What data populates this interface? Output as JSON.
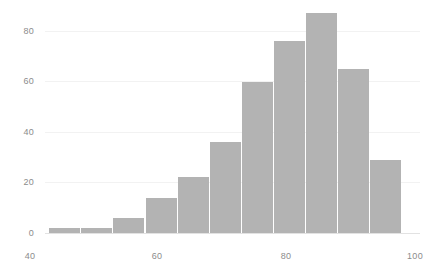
{
  "chart_data": {
    "type": "bar",
    "title": "",
    "subtitle": "",
    "xlabel": "",
    "ylabel": "",
    "xlim": [
      40,
      101
    ],
    "ylim": [
      0,
      92
    ],
    "grid": false,
    "legend": null,
    "bin_width": 5,
    "bin_starts": [
      43,
      48,
      53,
      58,
      63,
      68,
      73,
      78,
      83,
      88,
      93
    ],
    "categories": [
      "43-48",
      "48-53",
      "53-58",
      "58-63",
      "63-68",
      "68-73",
      "73-78",
      "78-83",
      "83-88",
      "88-93",
      "93-98"
    ],
    "values": [
      2,
      2,
      6,
      14,
      22,
      36,
      60,
      76,
      87,
      65,
      29
    ],
    "x_ticks": [
      {
        "value": 40,
        "label": "40"
      },
      {
        "value": 60,
        "label": "60"
      },
      {
        "value": 80,
        "label": "80"
      },
      {
        "value": 100,
        "label": "100"
      }
    ],
    "y_ticks": [
      {
        "value": 0,
        "label": "0"
      },
      {
        "value": 20,
        "label": "20"
      },
      {
        "value": 40,
        "label": "40"
      },
      {
        "value": 60,
        "label": "60"
      },
      {
        "value": 80,
        "label": "80"
      }
    ],
    "bar_color": "#b3b3b3",
    "axis_label_color": "#8c8c8c",
    "background_color": "#ffffff"
  },
  "axis": {
    "y_labels": [
      "80",
      "60",
      "40",
      "20",
      "0"
    ],
    "x_labels": [
      "40",
      "60",
      "80",
      "100"
    ]
  }
}
